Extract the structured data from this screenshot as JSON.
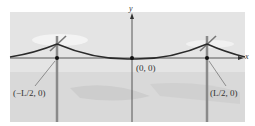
{
  "figure": {
    "axes": {
      "x_label": "x",
      "y_label": "y"
    },
    "points": [
      {
        "id": "left-pole-base",
        "label": "(−L/2, 0)"
      },
      {
        "id": "origin",
        "label": "(0, 0)"
      },
      {
        "id": "right-pole-base",
        "label": "(L/2, 0)"
      }
    ],
    "colors": {
      "background_sky": "#e6e6e6",
      "ground": "#d6d6d6",
      "cloud": "#f4f4f4",
      "pole": "#8a8a8a",
      "wire": "#2a2a2a",
      "axis": "#333333"
    }
  }
}
